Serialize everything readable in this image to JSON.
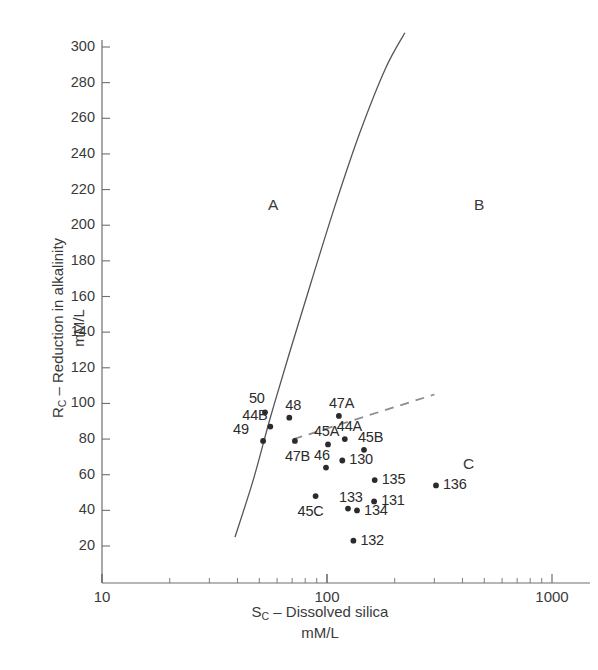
{
  "figure": {
    "background": "#ffffff",
    "ink": "#2b2b2b"
  },
  "axes": {
    "y_label_main": "R",
    "y_label_sub": "C",
    "y_label_rest": " – Reduction in alkalinity",
    "y_label_units": "mM/L",
    "x_label_main": "S",
    "x_label_sub": "C",
    "x_label_rest": " – Dissolved silica",
    "x_label_units": "mM/L",
    "y_ticks": [
      20,
      40,
      60,
      80,
      100,
      120,
      140,
      160,
      180,
      200,
      220,
      240,
      260,
      280,
      300
    ],
    "x_ticks": [
      10,
      100,
      1000
    ],
    "x_scale": "log",
    "y_scale": "linear"
  },
  "zones": [
    {
      "name": "zone-a",
      "label": "A",
      "x": 268,
      "y": 196
    },
    {
      "name": "zone-b",
      "label": "B",
      "x": 474,
      "y": 196
    },
    {
      "name": "zone-c",
      "label": "C",
      "x": 463,
      "y": 455
    }
  ],
  "chart_data": {
    "type": "scatter",
    "title": "",
    "xlabel": "S_C – Dissolved silica mM/L",
    "ylabel": "R_C – Reduction in alkalinity mM/L",
    "xscale": "log",
    "yscale": "linear",
    "xlim": [
      10,
      1000
    ],
    "ylim": [
      10,
      308
    ],
    "grid": false,
    "legend": null,
    "points": [
      {
        "label": "50",
        "x": 53,
        "y": 95,
        "lx": -16,
        "ly": -22
      },
      {
        "label": "44B",
        "x": 56,
        "y": 87,
        "lx": -28,
        "ly": -20
      },
      {
        "label": "49",
        "x": 52,
        "y": 79,
        "lx": -30,
        "ly": -20
      },
      {
        "label": "48",
        "x": 68,
        "y": 92,
        "lx": -4,
        "ly": -21
      },
      {
        "label": "47A",
        "x": 113,
        "y": 93,
        "lx": -10,
        "ly": -21
      },
      {
        "label": "47B",
        "x": 72,
        "y": 79,
        "lx": -10,
        "ly": 7
      },
      {
        "label": "45A",
        "x": 101,
        "y": 77,
        "lx": -14,
        "ly": -21
      },
      {
        "label": "44A",
        "x": 120,
        "y": 80,
        "lx": -8,
        "ly": -21
      },
      {
        "label": "45B",
        "x": 146,
        "y": 74,
        "lx": -6,
        "ly": -21
      },
      {
        "label": "46",
        "x": 99,
        "y": 64,
        "lx": -12,
        "ly": -21
      },
      {
        "label": "130",
        "x": 117,
        "y": 68,
        "lx": 7,
        "ly": -9
      },
      {
        "label": "135",
        "x": 163,
        "y": 57,
        "lx": 7,
        "ly": -9
      },
      {
        "label": "136",
        "x": 305,
        "y": 54,
        "lx": 7,
        "ly": -9
      },
      {
        "label": "45C",
        "x": 89,
        "y": 48,
        "lx": -18,
        "ly": 7
      },
      {
        "label": "133",
        "x": 124,
        "y": 41,
        "lx": -9,
        "ly": -20
      },
      {
        "label": "134",
        "x": 136,
        "y": 40,
        "lx": 7,
        "ly": -8
      },
      {
        "label": "131",
        "x": 162,
        "y": 45,
        "lx": 7,
        "ly": -9
      },
      {
        "label": "132",
        "x": 131,
        "y": 23,
        "lx": 7,
        "ly": -9
      }
    ],
    "curves": [
      {
        "name": "solid-boundary",
        "style": "solid",
        "color": "#55555a",
        "points": [
          [
            39,
            25
          ],
          [
            47,
            57
          ],
          [
            56,
            92
          ],
          [
            68,
            128
          ],
          [
            85,
            168
          ],
          [
            108,
            210
          ],
          [
            140,
            252
          ],
          [
            182,
            288
          ],
          [
            222,
            308
          ]
        ]
      },
      {
        "name": "dashed-boundary",
        "style": "dashed",
        "color": "#8d8d92",
        "points": [
          [
            71,
            80
          ],
          [
            300,
            105
          ]
        ]
      }
    ]
  }
}
